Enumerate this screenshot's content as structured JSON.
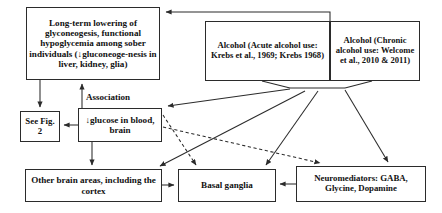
{
  "diagram": {
    "nodes": {
      "long_term": "Long-term lowering of glyconeogesis, functional hypoglycemia among sober individuals (↓gluconeoge-nesis in liver, kidney, glia)",
      "alcohol_acute": "Alcohol (Acute alcohol use: Krebs et al., 1969; Krebs 1968)",
      "alcohol_chronic": "Alcohol (Chronic alcohol use: Welcome et al., 2010 & 2011)",
      "see_fig": "See Fig. 2",
      "glucose": "↓glucose in blood, brain",
      "other_brain": "Other brain areas, including the cortex",
      "basal_ganglia": "Basal ganglia",
      "neuromediators": "Neuromediators: GABA, Glycine, Dopamine"
    },
    "edge_labels": {
      "association": "Association"
    },
    "colors": {
      "stroke": "#2b2b2b",
      "text": "#111111",
      "background": "#ffffff"
    }
  }
}
